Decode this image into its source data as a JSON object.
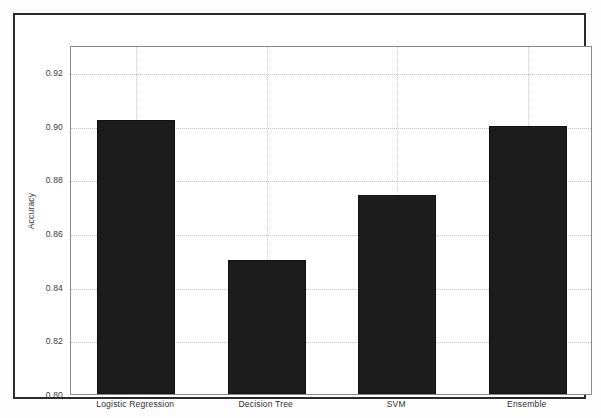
{
  "chart_data": {
    "type": "bar",
    "title": "",
    "subtitle": "",
    "xlabel": "",
    "ylabel": "Accuracy",
    "categories": [
      "Logistic Regression",
      "Decision Tree",
      "SVM",
      "Ensemble"
    ],
    "values": [
      0.902,
      0.85,
      0.874,
      0.9
    ],
    "series": [
      {
        "name": "Accuracy",
        "values": [
          0.902,
          0.85,
          0.874,
          0.9
        ]
      }
    ],
    "ylim": [
      0.8,
      0.93
    ],
    "xlim": [
      -0.5,
      3.5
    ],
    "ytick_labels": [
      "0.92",
      "0.90",
      "0.88",
      "0.86",
      "0.84",
      "0.82",
      "0.80"
    ],
    "ytick_values": [
      0.92,
      0.9,
      0.88,
      0.86,
      0.84,
      0.82,
      0.8
    ],
    "xtick_labels": [
      "Logistic Regression",
      "Decision Tree",
      "SVM",
      "Ensemble"
    ],
    "grid": true,
    "grid_style": "dotted",
    "legend": false,
    "legend_position": "none",
    "bar_color": "#1c1c1c",
    "grid_color": "#c3c3c3",
    "axis_color": "#8a8a8a",
    "frame_color": "#2b2b2b",
    "background_color": "#ffffff",
    "annotations": []
  },
  "axes": {
    "y_title": "Accuracy",
    "y_ticks": [
      {
        "label": "0.92",
        "value": 0.92
      },
      {
        "label": "0.90",
        "value": 0.9
      },
      {
        "label": "0.88",
        "value": 0.88
      },
      {
        "label": "0.86",
        "value": 0.86
      },
      {
        "label": "0.84",
        "value": 0.84
      },
      {
        "label": "0.82",
        "value": 0.82
      },
      {
        "label": "0.80",
        "value": 0.8
      }
    ],
    "x_ticks": [
      {
        "label": "Logistic Regression",
        "value": 0
      },
      {
        "label": "Decision Tree",
        "value": 1
      },
      {
        "label": "SVM",
        "value": 2
      },
      {
        "label": "Ensemble",
        "value": 3
      }
    ]
  },
  "bars": [
    {
      "label": "Logistic Regression",
      "value": 0.902
    },
    {
      "label": "Decision Tree",
      "value": 0.85
    },
    {
      "label": "SVM",
      "value": 0.874
    },
    {
      "label": "Ensemble",
      "value": 0.9
    }
  ]
}
